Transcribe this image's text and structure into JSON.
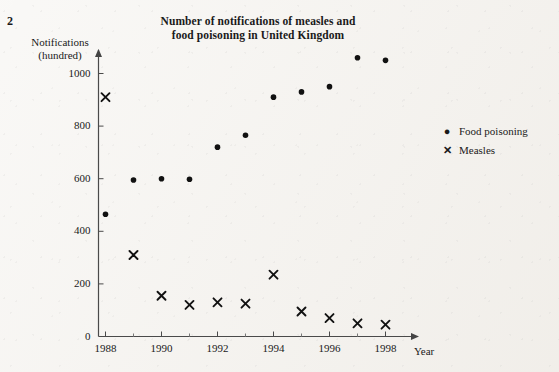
{
  "page_number": "2",
  "chart_data": {
    "type": "scatter",
    "title": "Number of notifications of measles and food poisoning in United Kingdom",
    "title_lines": [
      "Number of notifications of measles and",
      "food poisoning in United Kingdom"
    ],
    "xlabel": "Year",
    "ylabel": "Notifications (hundred)",
    "ylabel_lines": [
      "Notifications",
      "(hundred)"
    ],
    "x": [
      1988,
      1989,
      1990,
      1991,
      1992,
      1993,
      1994,
      1995,
      1996,
      1997,
      1998
    ],
    "xlim": [
      1987.3,
      1998.9
    ],
    "ylim": [
      0,
      1100
    ],
    "xticks": [
      1988,
      1990,
      1992,
      1994,
      1996,
      1998
    ],
    "xtick_labels": [
      "1988",
      "1990",
      "1992",
      "1994",
      "1996",
      "1998"
    ],
    "xminor_ticks": [
      1989,
      1991,
      1993,
      1995,
      1997
    ],
    "yticks": [
      0,
      200,
      400,
      600,
      800,
      1000
    ],
    "ytick_labels": [
      "0",
      "200",
      "400",
      "600",
      "800",
      "1000"
    ],
    "grid": false,
    "legend_position": "right",
    "axis_color": "#555555",
    "marker_color": "#111111",
    "series": [
      {
        "name": "Food poisoning",
        "marker": "dot",
        "values": [
          465,
          595,
          600,
          598,
          720,
          765,
          910,
          930,
          950,
          1060,
          1050
        ]
      },
      {
        "name": "Measles",
        "marker": "x",
        "values": [
          910,
          310,
          155,
          120,
          130,
          125,
          235,
          95,
          70,
          50,
          45
        ]
      }
    ]
  }
}
